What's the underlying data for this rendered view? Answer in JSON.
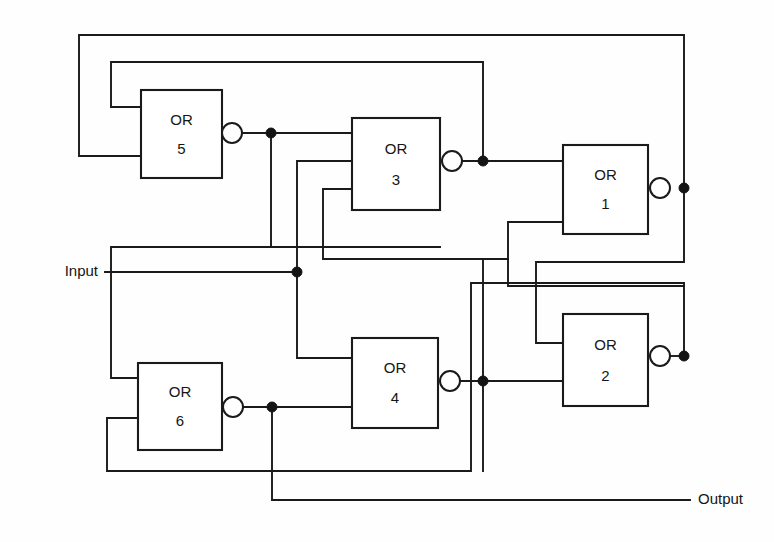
{
  "diagram": {
    "type": "logic-gate-schematic",
    "background_color": "#fefefe",
    "line_color": "#1a1a1a",
    "labels": {
      "input": "Input",
      "output": "Output"
    },
    "gate_type_label": "OR",
    "gates": [
      {
        "id": "or5",
        "type": "OR",
        "number": "5",
        "x": 141,
        "y": 90,
        "w": 81,
        "h": 88,
        "inverted": true
      },
      {
        "id": "or3",
        "type": "OR",
        "number": "3",
        "x": 352,
        "y": 118,
        "w": 88,
        "h": 92,
        "inverted": true
      },
      {
        "id": "or1",
        "type": "OR",
        "number": "1",
        "x": 563,
        "y": 145,
        "w": 85,
        "h": 89,
        "inverted": true
      },
      {
        "id": "or2",
        "type": "OR",
        "number": "2",
        "x": 563,
        "y": 314,
        "w": 85,
        "h": 92,
        "inverted": true
      },
      {
        "id": "or4",
        "type": "OR",
        "number": "4",
        "x": 352,
        "y": 338,
        "w": 86,
        "h": 90,
        "inverted": true
      },
      {
        "id": "or6",
        "type": "OR",
        "number": "6",
        "x": 138,
        "y": 363,
        "w": 84,
        "h": 87,
        "inverted": true
      }
    ],
    "bubbles": [
      {
        "id": "bubble-or5",
        "cx": 232,
        "cy": 133,
        "r": 10
      },
      {
        "id": "bubble-or3",
        "cx": 452,
        "cy": 161,
        "r": 10
      },
      {
        "id": "bubble-or1",
        "cx": 660,
        "cy": 188,
        "r": 10
      },
      {
        "id": "bubble-or2",
        "cx": 660,
        "cy": 356,
        "r": 10
      },
      {
        "id": "bubble-or4",
        "cx": 450,
        "cy": 381,
        "r": 10
      },
      {
        "id": "bubble-or6",
        "cx": 233,
        "cy": 407,
        "r": 10
      }
    ],
    "junctions": [
      {
        "id": "dot-or5-out",
        "cx": 271,
        "cy": 133,
        "r": 5
      },
      {
        "id": "dot-or3-out",
        "cx": 483,
        "cy": 161,
        "r": 5
      },
      {
        "id": "dot-or1-out",
        "cx": 684,
        "cy": 188,
        "r": 5
      },
      {
        "id": "dot-input",
        "cx": 297,
        "cy": 272,
        "r": 5
      },
      {
        "id": "dot-or2-out",
        "cx": 684,
        "cy": 356,
        "r": 5
      },
      {
        "id": "dot-or4-out",
        "cx": 483,
        "cy": 381,
        "r": 5
      },
      {
        "id": "dot-or6-out",
        "cx": 272,
        "cy": 407,
        "r": 5
      }
    ],
    "wires": [
      {
        "id": "w-or1-top-rail",
        "d": "M 684 188 L 684 35 L 79 35 L 79 156 L 141 156"
      },
      {
        "id": "w-or3-to-or5",
        "d": "M 483 161 L 483 62 L 111 62 L 111 107 L 141 107"
      },
      {
        "id": "w-or5-out",
        "d": "M 242 133 L 352 133"
      },
      {
        "id": "w-or5-down",
        "d": "M 271 133 L 271 247 L 440 247"
      },
      {
        "id": "w-or3-out",
        "d": "M 462 161 L 563 161"
      },
      {
        "id": "w-input-main",
        "d": "M 105 272 L 297 272"
      },
      {
        "id": "w-input-up-or3",
        "d": "M 297 272 L 297 161 L 352 161"
      },
      {
        "id": "w-input-up-left",
        "d": "M 111 272 L 111 247 L 323 247"
      },
      {
        "id": "w-input-down-or6",
        "d": "M 111 272 L 111 378 L 138 378"
      },
      {
        "id": "w-input-down-or4",
        "d": "M 297 272 L 297 358 L 352 358"
      },
      {
        "id": "w-or3-third-in",
        "d": "M 352 189 L 323 189 L 323 259 L 508 259"
      },
      {
        "id": "w-or1-bot-in",
        "d": "M 563 222 L 508 222 L 508 286 L 684 286"
      },
      {
        "id": "w-or1-down",
        "d": "M 684 188 L 684 262 L 536 262 L 536 343 L 563 343"
      },
      {
        "id": "w-or2-out",
        "d": "M 670 356 L 684 356"
      },
      {
        "id": "w-or2-up",
        "d": "M 684 356 L 684 283 L 471 283 L 471 471 L 107 471 L 107 418 L 138 418"
      },
      {
        "id": "w-or4-out",
        "d": "M 460 381 L 563 381"
      },
      {
        "id": "w-or4-up",
        "d": "M 483 381 L 483 259"
      },
      {
        "id": "w-or4-down",
        "d": "M 483 381 L 483 471"
      },
      {
        "id": "w-or6-out",
        "d": "M 243 407 L 352 407"
      },
      {
        "id": "w-or6-to-output",
        "d": "M 272 407 L 272 500 L 690 500"
      }
    ],
    "io_ports": [
      {
        "id": "input-port",
        "label": "Input",
        "x": 98,
        "y": 272,
        "align": "left"
      },
      {
        "id": "output-port",
        "label": "Output",
        "x": 698,
        "y": 500,
        "align": "right"
      }
    ]
  }
}
